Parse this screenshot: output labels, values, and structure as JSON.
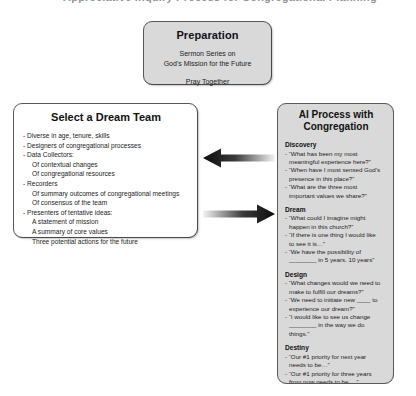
{
  "slide": {
    "clipped_top_text": "Appreciative Inquiry Process for Congregational Planning"
  },
  "preparation": {
    "title": "Preparation",
    "line1": "Sermon Series on",
    "line2": "God's Mission for the Future",
    "line3": "Pray Together"
  },
  "dream_team": {
    "title": "Select a Dream Team",
    "items": [
      {
        "text": "- Diverse in age, tenure, skills",
        "sub": false
      },
      {
        "text": "- Designers of congregational processes",
        "sub": false
      },
      {
        "text": "- Data Collectors:",
        "sub": false
      },
      {
        "text": "Of contextual changes",
        "sub": true
      },
      {
        "text": "Of congregational resources",
        "sub": true
      },
      {
        "text": "- Recorders",
        "sub": false
      },
      {
        "text": "Of summary outcomes of congregational meetings",
        "sub": true
      },
      {
        "text": "Of consensus of the team",
        "sub": true
      },
      {
        "text": "- Presenters of tentative ideas:",
        "sub": false
      },
      {
        "text": "A statement of mission",
        "sub": true
      },
      {
        "text": "A summary of core values",
        "sub": true
      },
      {
        "text": "Three potential actions for the future",
        "sub": true
      }
    ]
  },
  "ai_process": {
    "title_line1": "AI Process with",
    "title_line2": "Congregation",
    "sections": [
      {
        "heading": "Discovery",
        "items": [
          {
            "lead": "- “What has been my most",
            "cont": [
              "meaningful experience here?”"
            ]
          },
          {
            "lead": "- “When have I most sensed God’s",
            "cont": [
              "presence in this place?”"
            ]
          },
          {
            "lead": "- “What are the three most",
            "cont": [
              "important values we share?”"
            ]
          }
        ]
      },
      {
        "heading": "Dream",
        "items": [
          {
            "lead": "- “What could I imagine might",
            "cont": [
              "happen in this church?”"
            ]
          },
          {
            "lead": "- “If there is one thing I would like",
            "cont": [
              "to see it is…”"
            ]
          },
          {
            "lead": "- “We have the possibility of",
            "cont": [
              "________ in 5 years.  10 years”"
            ]
          }
        ]
      },
      {
        "heading": "Design",
        "items": [
          {
            "lead": "- “What changes would we need to",
            "cont": [
              "make to fulfill our dreams?”"
            ]
          },
          {
            "lead": "- “We need to initiate new ____ to",
            "cont": [
              "experience our dream?”"
            ]
          },
          {
            "lead": "- “I would like to see us change",
            "cont": [
              "________ in the way we do",
              "things.”"
            ]
          }
        ]
      },
      {
        "heading": "Destiny",
        "items": [
          {
            "lead": "- “Our #1 priority for next year",
            "cont": [
              "needs to be…”"
            ]
          },
          {
            "lead": "- “Our #1 priority for three years",
            "cont": [
              "from now needs to be …”"
            ]
          }
        ]
      }
    ]
  },
  "arrows": [
    {
      "name": "arrow-pointing-left",
      "direction": "left"
    },
    {
      "name": "arrow-pointing-right",
      "direction": "right"
    }
  ],
  "colors": {
    "box_border": "#5a5a5a",
    "box_shaded_fill": "#d9d9d9",
    "box_plain_fill": "#ffffff",
    "arrow_dark": "#0d0d0d",
    "arrow_light": "#f2f2f2",
    "text": "#1a1a1a",
    "page_background": "#ffffff"
  }
}
